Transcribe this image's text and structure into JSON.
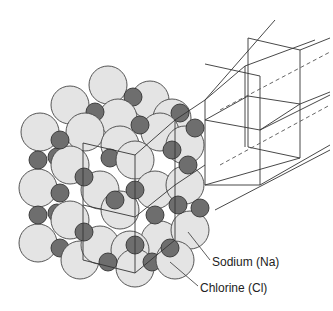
{
  "figure": {
    "labels": {
      "sodium": "Sodium (Na)",
      "chlorine": "Chlorine (Cl)"
    },
    "colors": {
      "chlorine_fill": "#e4e4e4",
      "sodium_fill": "#6e6e6e",
      "outline": "#444444",
      "lines": "#333333"
    }
  }
}
